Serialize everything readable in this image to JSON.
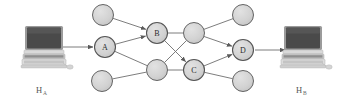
{
  "figure": {
    "background_color": "#ffffff"
  },
  "hosts": [
    {
      "id": "host-a",
      "label_main": "H",
      "label_sub": "A",
      "icon": "computer-icon",
      "position": {
        "x": 44,
        "y": 48
      },
      "label_position": {
        "x": 36,
        "y": 89
      }
    },
    {
      "id": "host-b",
      "label_main": "H",
      "label_sub": "B",
      "icon": "computer-icon",
      "position": {
        "x": 303,
        "y": 48
      },
      "label_position": {
        "x": 296,
        "y": 89
      }
    }
  ],
  "colors": {
    "node_fill": "#d2d2d2",
    "node_stroke": "#555555",
    "labeled_node_fill": "#cfcfcf",
    "edge_stroke": "#6e6e6e",
    "text": "#2b2b2b",
    "screen_dark": "#4a4a4a",
    "computer_body": "#cccccc"
  },
  "nodes": [
    {
      "id": "n-top-left",
      "label": "",
      "x": 103,
      "y": 15,
      "r": 10.5,
      "labeled": false
    },
    {
      "id": "n-a",
      "label": "A",
      "x": 105,
      "y": 47,
      "r": 10.5,
      "labeled": true
    },
    {
      "id": "n-bottom-left",
      "label": "",
      "x": 102,
      "y": 81,
      "r": 10.5,
      "labeled": false
    },
    {
      "id": "n-b",
      "label": "B",
      "x": 157,
      "y": 33,
      "r": 10.5,
      "labeled": true
    },
    {
      "id": "n-mid-low",
      "label": "",
      "x": 157,
      "y": 70,
      "r": 10.5,
      "labeled": false
    },
    {
      "id": "n-mid-up",
      "label": "",
      "x": 194,
      "y": 33,
      "r": 10.5,
      "labeled": false
    },
    {
      "id": "n-c",
      "label": "C",
      "x": 194,
      "y": 70,
      "r": 10.5,
      "labeled": true
    },
    {
      "id": "n-top-right",
      "label": "",
      "x": 243,
      "y": 15,
      "r": 10.5,
      "labeled": false
    },
    {
      "id": "n-d",
      "label": "D",
      "x": 243,
      "y": 50,
      "r": 10.5,
      "labeled": true
    },
    {
      "id": "n-bottom-right",
      "label": "",
      "x": 243,
      "y": 81,
      "r": 10.5,
      "labeled": false
    }
  ],
  "edges": [
    {
      "from": "n-top-left",
      "to": "n-b",
      "arrow": true
    },
    {
      "from": "n-a",
      "to": "n-b",
      "arrow": true
    },
    {
      "from": "n-a",
      "to": "n-mid-low",
      "arrow": false
    },
    {
      "from": "n-bottom-left",
      "to": "n-mid-low",
      "arrow": false
    },
    {
      "from": "n-b",
      "to": "n-mid-up",
      "arrow": false
    },
    {
      "from": "n-b",
      "to": "n-c",
      "arrow": true
    },
    {
      "from": "n-mid-low",
      "to": "n-mid-up",
      "arrow": false
    },
    {
      "from": "n-mid-low",
      "to": "n-c",
      "arrow": false
    },
    {
      "from": "n-mid-up",
      "to": "n-top-right",
      "arrow": false
    },
    {
      "from": "n-mid-up",
      "to": "n-d",
      "arrow": true
    },
    {
      "from": "n-c",
      "to": "n-d",
      "arrow": true
    },
    {
      "from": "n-c",
      "to": "n-bottom-right",
      "arrow": false
    }
  ],
  "host_links": [
    {
      "id": "link-host-a-to-a",
      "from_x": 63,
      "from_y": 47,
      "to_x": 93,
      "to_y": 47,
      "arrow": true
    },
    {
      "id": "link-d-to-host-b",
      "from_x": 255,
      "from_y": 50,
      "to_x": 285,
      "to_y": 50,
      "arrow": true
    }
  ]
}
